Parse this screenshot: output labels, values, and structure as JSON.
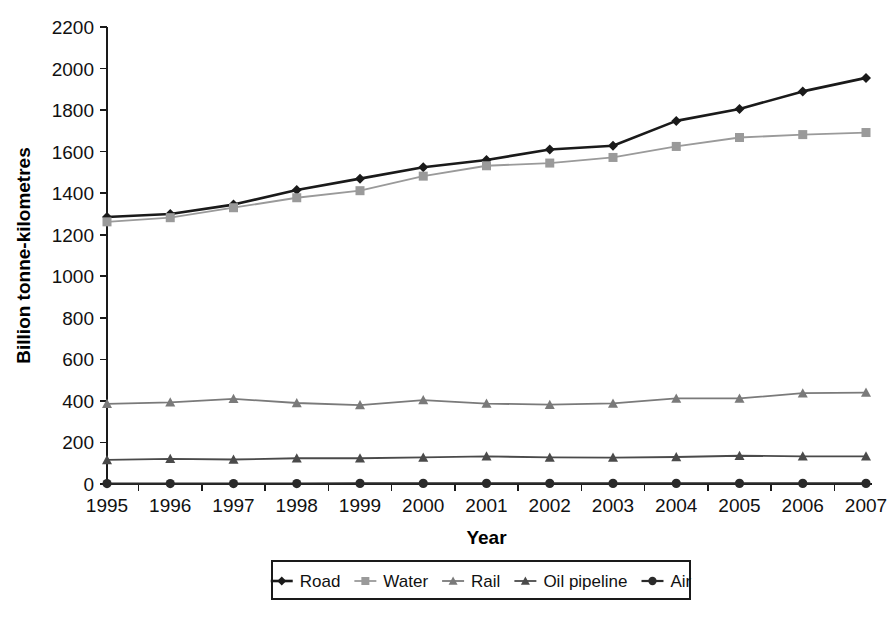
{
  "chart_data": {
    "type": "line",
    "title": "",
    "xlabel": "Year",
    "ylabel": "Billion tonne-kilometres",
    "categories": [
      1995,
      1996,
      1997,
      1998,
      1999,
      2000,
      2001,
      2002,
      2003,
      2004,
      2005,
      2006,
      2007
    ],
    "x_tick_labels": [
      "1995",
      "1996",
      "1997",
      "1998",
      "1999",
      "2000",
      "2001",
      "2002",
      "2003",
      "2004",
      "2005",
      "2006",
      "2007"
    ],
    "y_tick_labels": [
      "0",
      "200",
      "400",
      "600",
      "800",
      "1000",
      "1200",
      "1400",
      "1600",
      "1800",
      "2000",
      "2200"
    ],
    "y_ticks": [
      0,
      200,
      400,
      600,
      800,
      1000,
      1200,
      1400,
      1600,
      1800,
      2000,
      2200
    ],
    "ylim": [
      0,
      2200
    ],
    "grid": false,
    "legend_position": "bottom",
    "series": [
      {
        "name": "Road",
        "color": "#1a1a1a",
        "marker": "diamond",
        "marker_color": "#1a1a1a",
        "line_width": 2.6,
        "values": [
          1285,
          1300,
          1345,
          1415,
          1470,
          1525,
          1560,
          1610,
          1628,
          1748,
          1805,
          1890,
          1955
        ]
      },
      {
        "name": "Water",
        "color": "#9a9a9a",
        "marker": "square",
        "marker_color": "#9a9a9a",
        "line_width": 1.8,
        "values": [
          1262,
          1282,
          1330,
          1378,
          1412,
          1482,
          1532,
          1545,
          1572,
          1625,
          1668,
          1682,
          1692
        ]
      },
      {
        "name": "Rail",
        "color": "#7a7a7a",
        "marker": "triangle",
        "marker_color": "#7a7a7a",
        "line_width": 1.8,
        "values": [
          386,
          393,
          410,
          390,
          380,
          404,
          387,
          382,
          388,
          412,
          412,
          437,
          440
        ]
      },
      {
        "name": "Oil pipeline",
        "color": "#4a4a4a",
        "marker": "triangle",
        "marker_color": "#4a4a4a",
        "line_width": 1.8,
        "values": [
          116,
          121,
          118,
          124,
          124,
          128,
          133,
          128,
          127,
          130,
          136,
          133,
          133
        ]
      },
      {
        "name": "Air",
        "color": "#2a2a2a",
        "marker": "circle",
        "marker_color": "#2a2a2a",
        "line_width": 2.2,
        "values": [
          2,
          2,
          2,
          2,
          3,
          3,
          3,
          3,
          3,
          3,
          3,
          3,
          3
        ]
      }
    ]
  },
  "legend": {
    "items": [
      {
        "label": "Road"
      },
      {
        "label": "Water"
      },
      {
        "label": "Rail"
      },
      {
        "label": "Oil pipeline"
      },
      {
        "label": "Air"
      }
    ]
  },
  "layout": {
    "plot_left": 107,
    "plot_right": 866,
    "plot_top": 27,
    "plot_bottom": 484,
    "legend_box": {
      "x": 272,
      "y": 561,
      "width": 418,
      "height": 38
    }
  }
}
